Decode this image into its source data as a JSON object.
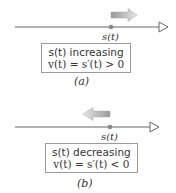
{
  "panels": [
    {
      "id": "a",
      "position_label": "s(t)",
      "line1": "s(t) increasing",
      "line2": "v(t) = s′(t) > 0",
      "caption": "(a)",
      "arrow_direction": "right"
    },
    {
      "id": "b",
      "position_label": "s(t)",
      "line1": "s(t) decreasing",
      "line2": "v(t) = s′(t) < 0",
      "caption": "(b)",
      "arrow_direction": "left"
    }
  ],
  "colors": {
    "line": "#666666",
    "dot": "#888888",
    "arrow_dark": "#9a9a9a",
    "arrow_light": "#e0e0e0"
  }
}
